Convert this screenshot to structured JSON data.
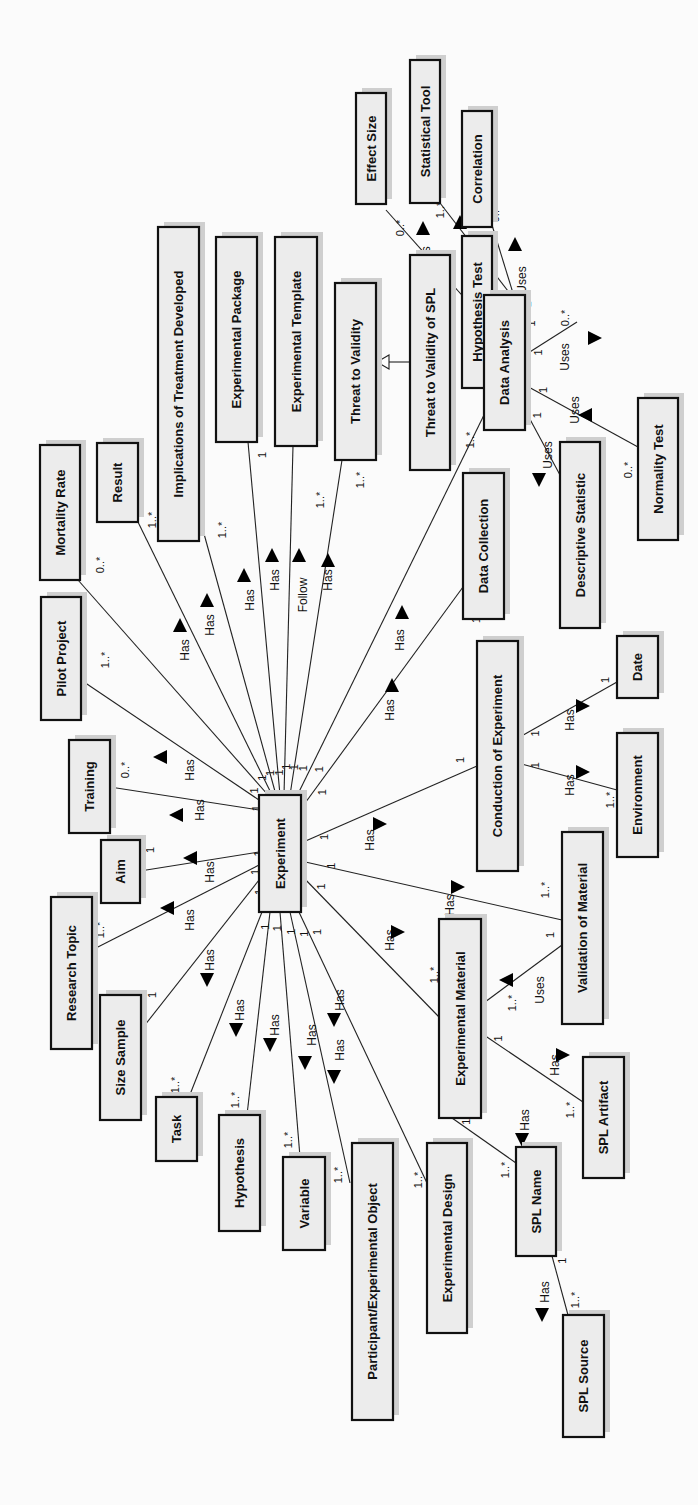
{
  "diagram": {
    "colors": {
      "box_fill": "#ececec",
      "box_border": "#111111",
      "shadow": "#cfcfcf",
      "line": "#222222",
      "background": "#fbfbfb"
    },
    "classes": [
      {
        "id": "experiment",
        "label": "Experiment",
        "x": 259,
        "y": 795,
        "w": 42,
        "h": 117
      },
      {
        "id": "mortality_rate",
        "label": "Mortality Rate",
        "x": 40,
        "y": 445,
        "w": 40,
        "h": 135
      },
      {
        "id": "result",
        "label": "Result",
        "x": 97,
        "y": 443,
        "w": 41,
        "h": 79
      },
      {
        "id": "implications",
        "label": "Implications of Treatment Developed",
        "x": 158,
        "y": 227,
        "w": 41,
        "h": 314
      },
      {
        "id": "experimental_package",
        "label": "Experimental Package",
        "x": 216,
        "y": 237,
        "w": 41,
        "h": 205
      },
      {
        "id": "experimental_template",
        "label": "Experimental Template",
        "x": 275,
        "y": 237,
        "w": 42,
        "h": 209
      },
      {
        "id": "threat_to_validity",
        "label": "Threat to Validity",
        "x": 335,
        "y": 283,
        "w": 41,
        "h": 177
      },
      {
        "id": "threat_spl",
        "label": "Threat to Validity of SPL",
        "x": 410,
        "y": 255,
        "w": 40,
        "h": 215
      },
      {
        "id": "effect_size",
        "label": "Effect Size",
        "x": 356,
        "y": 93,
        "w": 30,
        "h": 111
      },
      {
        "id": "statistical_tool",
        "label": "Statistical Tool",
        "x": 410,
        "y": 60,
        "w": 30,
        "h": 143
      },
      {
        "id": "correlation",
        "label": "Correlation",
        "x": 462,
        "y": 111,
        "w": 30,
        "h": 116
      },
      {
        "id": "hypothesis_test",
        "label": "Hypothesis Test",
        "x": 462,
        "y": 236,
        "w": 30,
        "h": 152
      },
      {
        "id": "data_analysis",
        "label": "Data Analysis",
        "x": 484,
        "y": 295,
        "w": 41,
        "h": 135
      },
      {
        "id": "normality_test",
        "label": "Normality Test",
        "x": 638,
        "y": 398,
        "w": 40,
        "h": 142
      },
      {
        "id": "descriptive_statistic",
        "label": "Descriptive Statistic",
        "x": 560,
        "y": 442,
        "w": 40,
        "h": 186
      },
      {
        "id": "data_collection",
        "label": "Data Collection",
        "x": 463,
        "y": 473,
        "w": 41,
        "h": 146
      },
      {
        "id": "pilot_project",
        "label": "Pilot Project",
        "x": 41,
        "y": 597,
        "w": 40,
        "h": 123
      },
      {
        "id": "training",
        "label": "Training",
        "x": 69,
        "y": 740,
        "w": 41,
        "h": 93
      },
      {
        "id": "aim",
        "label": "Aim",
        "x": 101,
        "y": 840,
        "w": 39,
        "h": 63
      },
      {
        "id": "research_topic",
        "label": "Research Topic",
        "x": 51,
        "y": 897,
        "w": 41,
        "h": 152
      },
      {
        "id": "size_sample",
        "label": "Size Sample",
        "x": 100,
        "y": 995,
        "w": 41,
        "h": 125
      },
      {
        "id": "task",
        "label": "Task",
        "x": 156,
        "y": 1097,
        "w": 41,
        "h": 64
      },
      {
        "id": "hypothesis",
        "label": "Hypothesis",
        "x": 219,
        "y": 1115,
        "w": 41,
        "h": 116
      },
      {
        "id": "variable",
        "label": "Variable",
        "x": 283,
        "y": 1157,
        "w": 42,
        "h": 93
      },
      {
        "id": "participant",
        "label": "Participant/Experimental Object",
        "x": 352,
        "y": 1143,
        "w": 41,
        "h": 277
      },
      {
        "id": "experimental_design",
        "label": "Experimental Design",
        "x": 427,
        "y": 1143,
        "w": 40,
        "h": 190
      },
      {
        "id": "conduction",
        "label": "Conduction of Experiment",
        "x": 477,
        "y": 641,
        "w": 41,
        "h": 230
      },
      {
        "id": "date",
        "label": "Date",
        "x": 617,
        "y": 636,
        "w": 41,
        "h": 62
      },
      {
        "id": "environment",
        "label": "Environment",
        "x": 617,
        "y": 733,
        "w": 41,
        "h": 124
      },
      {
        "id": "validation_material",
        "label": "Validation of Material",
        "x": 562,
        "y": 832,
        "w": 41,
        "h": 192
      },
      {
        "id": "experimental_material",
        "label": "Experimental Material",
        "x": 439,
        "y": 919,
        "w": 42,
        "h": 199
      },
      {
        "id": "spl_artifact",
        "label": "SPL Artifact",
        "x": 583,
        "y": 1057,
        "w": 41,
        "h": 121
      },
      {
        "id": "spl_name",
        "label": "SPL Name",
        "x": 516,
        "y": 1147,
        "w": 40,
        "h": 109
      },
      {
        "id": "spl_source",
        "label": "SPL Source",
        "x": 563,
        "y": 1315,
        "w": 41,
        "h": 122
      }
    ],
    "associations": [
      {
        "from": [
          268,
          795
        ],
        "to": [
          78,
          580
        ],
        "label": "Has",
        "lx": 185,
        "ly": 650,
        "ax": 180,
        "ay": 625,
        "dir": "up",
        "m1": "1",
        "m2": "0..*",
        "m2x": 100,
        "m2y": 565
      },
      {
        "from": [
          272,
          795
        ],
        "to": [
          137,
          520
        ],
        "label": "Has",
        "lx": 210,
        "ly": 625,
        "ax": 207,
        "ay": 600,
        "dir": "up",
        "m1": "1",
        "m2": "1..*",
        "m2x": 152,
        "m2y": 520
      },
      {
        "from": [
          276,
          795
        ],
        "to": [
          198,
          512
        ],
        "label": "Has",
        "lx": 250,
        "ly": 600,
        "ax": 244,
        "ay": 575,
        "dir": "up",
        "m1": "1",
        "m2": "1..*",
        "m2x": 222,
        "m2y": 530
      },
      {
        "from": [
          280,
          795
        ],
        "to": [
          248,
          442
        ],
        "label": "Has",
        "lx": 275,
        "ly": 580,
        "ax": 272,
        "ay": 555,
        "dir": "up",
        "m1": "1",
        "m2": "1",
        "m2x": 262,
        "m2y": 455
      },
      {
        "from": [
          284,
          795
        ],
        "to": [
          293,
          446
        ],
        "label": "Follow",
        "lx": 303,
        "ly": 595,
        "ax": 299,
        "ay": 555,
        "dir": "up",
        "m1": "1",
        "m2": "1..*",
        "m2x": 320,
        "m2y": 500
      },
      {
        "from": [
          290,
          795
        ],
        "to": [
          342,
          460
        ],
        "label": "Has",
        "lx": 328,
        "ly": 580,
        "ax": 328,
        "ay": 560,
        "dir": "up",
        "m1": "1",
        "m2": "1..*",
        "m2x": 360,
        "m2y": 480
      },
      {
        "from": [
          295,
          800
        ],
        "to": [
          484,
          415
        ],
        "label": "Has",
        "lx": 400,
        "ly": 640,
        "ax": 402,
        "ay": 612,
        "dir": "up",
        "m1": "1",
        "m2": "1..*",
        "m2x": 470,
        "m2y": 440
      },
      {
        "from": [
          300,
          810
        ],
        "to": [
          463,
          587
        ],
        "label": "Has",
        "lx": 390,
        "ly": 710,
        "ax": 392,
        "ay": 685,
        "dir": "up",
        "m1": "1",
        "m2": "1",
        "m2x": 476,
        "m2y": 620
      },
      {
        "from": [
          301,
          843
        ],
        "to": [
          477,
          766
        ],
        "label": "Has",
        "lx": 370,
        "ly": 840,
        "ax": 380,
        "ay": 824,
        "dir": "right",
        "m1": "1",
        "m2": "1",
        "m2x": 460,
        "m2y": 760
      },
      {
        "from": [
          301,
          861
        ],
        "to": [
          562,
          920
        ],
        "label": "Has",
        "lx": 450,
        "ly": 905,
        "ax": 458,
        "ay": 887,
        "dir": "right",
        "m1": "1",
        "m2": "1..*",
        "m2x": 545,
        "m2y": 890
      },
      {
        "from": [
          301,
          875
        ],
        "to": [
          439,
          1017
        ],
        "label": "Has",
        "lx": 390,
        "ly": 940,
        "ax": 398,
        "ay": 932,
        "dir": "right",
        "m1": "1",
        "m2": "1..*",
        "m2x": 434,
        "m2y": 975
      },
      {
        "from": [
          259,
          810
        ],
        "to": [
          110,
          787
        ],
        "label": "Has",
        "lx": 200,
        "ly": 810,
        "ax": 176,
        "ay": 815,
        "dir": "left",
        "m1": "1",
        "m2": "0..*",
        "m2x": 125,
        "m2y": 770
      },
      {
        "from": [
          259,
          800
        ],
        "to": [
          81,
          680
        ],
        "label": "Has",
        "lx": 190,
        "ly": 770,
        "ax": 160,
        "ay": 757,
        "dir": "left",
        "m1": "1",
        "m2": "1..*",
        "m2x": 105,
        "m2y": 660
      },
      {
        "from": [
          259,
          852
        ],
        "to": [
          140,
          871
        ],
        "label": "Has",
        "lx": 210,
        "ly": 872,
        "ax": 190,
        "ay": 858,
        "dir": "left",
        "m1": "1",
        "m2": "1",
        "m2x": 150,
        "m2y": 850
      },
      {
        "from": [
          259,
          865
        ],
        "to": [
          92,
          950
        ],
        "label": "Has",
        "lx": 190,
        "ly": 920,
        "ax": 167,
        "ay": 908,
        "dir": "left",
        "m1": "1",
        "m2": "1..*",
        "m2x": 100,
        "m2y": 930
      },
      {
        "from": [
          259,
          880
        ],
        "to": [
          141,
          1030
        ],
        "label": "Has",
        "lx": 210,
        "ly": 960,
        "ax": 207,
        "ay": 980,
        "dir": "down",
        "m1": "1",
        "m2": "1",
        "m2x": 152,
        "m2y": 995
      },
      {
        "from": [
          262,
          912
        ],
        "to": [
          189,
          1097
        ],
        "label": "Has",
        "lx": 240,
        "ly": 1010,
        "ax": 236,
        "ay": 1030,
        "dir": "down",
        "m1": "1",
        "m2": "1..*",
        "m2x": 175,
        "m2y": 1085
      },
      {
        "from": [
          270,
          912
        ],
        "to": [
          247,
          1115
        ],
        "label": "Has",
        "lx": 275,
        "ly": 1025,
        "ax": 270,
        "ay": 1045,
        "dir": "down",
        "m1": "1",
        "m2": "1..*",
        "m2x": 235,
        "m2y": 1100
      },
      {
        "from": [
          280,
          912
        ],
        "to": [
          300,
          1157
        ],
        "label": "Has",
        "lx": 312,
        "ly": 1035,
        "ax": 305,
        "ay": 1063,
        "dir": "down",
        "m1": "1",
        "m2": "1..*",
        "m2x": 288,
        "m2y": 1140
      },
      {
        "from": [
          290,
          912
        ],
        "to": [
          350,
          1183
        ],
        "label": "Has",
        "lx": 340,
        "ly": 1050,
        "ax": 334,
        "ay": 1077,
        "dir": "down",
        "m1": "1",
        "m2": "1..*",
        "m2x": 338,
        "m2y": 1175
      },
      {
        "from": [
          298,
          910
        ],
        "to": [
          427,
          1183
        ],
        "label": "Has",
        "lx": 340,
        "ly": 1000,
        "ax": 334,
        "ay": 1020,
        "dir": "down",
        "m1": "1",
        "m2": "1..*",
        "m2x": 418,
        "m2y": 1180
      },
      {
        "from": [
          518,
          738
        ],
        "to": [
          617,
          682
        ],
        "label": "Has",
        "lx": 570,
        "ly": 720,
        "ax": 583,
        "ay": 706,
        "dir": "right",
        "m1": "1",
        "m2": "1",
        "m2x": 605,
        "m2y": 680
      },
      {
        "from": [
          518,
          763
        ],
        "to": [
          617,
          790
        ],
        "label": "Has",
        "lx": 570,
        "ly": 785,
        "ax": 583,
        "ay": 772,
        "dir": "right",
        "m1": "1",
        "m2": "1..*",
        "m2x": 610,
        "m2y": 800
      },
      {
        "from": [
          481,
          1005
        ],
        "to": [
          562,
          945
        ],
        "label": "Uses",
        "lx": 540,
        "ly": 990,
        "ax": 506,
        "ay": 980,
        "dir": "left",
        "m1": "1..*",
        "m1x": 512,
        "m1y": 1003,
        "m2": "1",
        "m2x": 550,
        "m2y": 935
      },
      {
        "from": [
          481,
          1033
        ],
        "to": [
          583,
          1102
        ],
        "label": "Has",
        "lx": 555,
        "ly": 1065,
        "ax": 563,
        "ay": 1055,
        "dir": "right",
        "m1": "1",
        "m2": "1..*",
        "m2x": 570,
        "m2y": 1110
      },
      {
        "from": [
          452,
          1118
        ],
        "to": [
          516,
          1163
        ],
        "label": "Has",
        "lx": 525,
        "ly": 1120,
        "ax": 522,
        "ay": 1140,
        "dir": "down",
        "m1": "1",
        "m2": "1..*",
        "m2x": 505,
        "m2y": 1170
      },
      {
        "from": [
          552,
          1256
        ],
        "to": [
          568,
          1315
        ],
        "label": "Has",
        "lx": 545,
        "ly": 1292,
        "ax": 542,
        "ay": 1315,
        "dir": "down",
        "m1": "1",
        "m2": "1..*",
        "m2x": 575,
        "m2y": 1300
      },
      {
        "from": [
          484,
          320
        ],
        "to": [
          386,
          210
        ],
        "label": "Uses",
        "lx": 426,
        "ly": 260,
        "ax": 423,
        "ay": 228,
        "dir": "up",
        "m1": "1",
        "m2": "0..*",
        "m2x": 400,
        "m2y": 228
      },
      {
        "from": [
          525,
          313
        ],
        "to": [
          440,
          203
        ],
        "label": "Uses",
        "lx": 468,
        "ly": 268,
        "ax": 460,
        "ay": 222,
        "dir": "up",
        "m1": "1",
        "m2": "1..*",
        "m2x": 440,
        "m2y": 210
      },
      {
        "from": [
          525,
          332
        ],
        "to": [
          492,
          225
        ],
        "label": "Uses",
        "lx": 522,
        "ly": 280,
        "ax": 515,
        "ay": 244,
        "dir": "up",
        "m1": "1",
        "m2": "0..*",
        "m2x": 495,
        "m2y": 214
      },
      {
        "from": [
          525,
          355
        ],
        "to": [
          577,
          322
        ],
        "label": "Uses",
        "lx": 565,
        "ly": 357,
        "ax": 595,
        "ay": 338,
        "dir": "right",
        "m1": "1",
        "m2": "0..*",
        "m2x": 565,
        "m2y": 318
      },
      {
        "from": [
          525,
          385
        ],
        "to": [
          638,
          447
        ],
        "label": "Uses",
        "lx": 575,
        "ly": 410,
        "ax": 585,
        "ay": 415,
        "dir": "left",
        "m1": "1",
        "m2": "0..*",
        "m2x": 628,
        "m2y": 470
      },
      {
        "from": [
          525,
          410
        ],
        "to": [
          560,
          475
        ],
        "label": "Uses",
        "lx": 548,
        "ly": 455,
        "ax": 539,
        "ay": 480,
        "dir": "down",
        "m1": "1",
        "m2": "",
        "m2x": 0,
        "m2y": 0
      }
    ],
    "generalizations": [
      {
        "child": "threat_spl",
        "parent": "threat_to_validity",
        "from": [
          410,
          362
        ],
        "to": [
          376,
          362
        ]
      }
    ]
  }
}
